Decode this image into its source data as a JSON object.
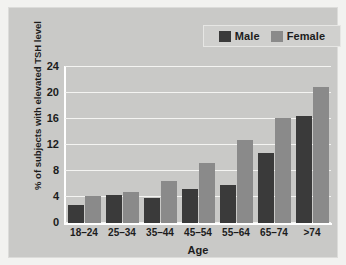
{
  "chart_data": {
    "type": "bar",
    "title": "",
    "xlabel": "Age",
    "ylabel": "% of subjects with elevated TSH level",
    "categories": [
      "18–24",
      "25–34",
      "35–44",
      "45–54",
      "55–64",
      "65–74",
      ">74"
    ],
    "series": [
      {
        "name": "Male",
        "color": "#3a3a3a",
        "values": [
          2.7,
          4.3,
          3.9,
          5.3,
          5.9,
          10.7,
          16.4
        ]
      },
      {
        "name": "Female",
        "color": "#8a8a8a",
        "values": [
          4.1,
          4.8,
          6.4,
          9.3,
          12.8,
          16.1,
          21.0
        ]
      }
    ],
    "ylim": [
      0,
      24
    ],
    "yticks": [
      0,
      4,
      8,
      12,
      16,
      20,
      24
    ],
    "ytick_labels": [
      "0",
      "4",
      "8",
      "12",
      "16",
      "20",
      "24"
    ],
    "grid": true,
    "legend_position": "top-right"
  },
  "legend": {
    "entries": [
      {
        "label": "Male"
      },
      {
        "label": "Female"
      }
    ]
  },
  "colors": {
    "background": "#c9c9c7",
    "page": "#f2f2f0",
    "grid": "#f4f4f2",
    "axis": "#ffffff",
    "text": "#1c1c1c",
    "male": "#3a3a3a",
    "female": "#8a8a8a"
  }
}
